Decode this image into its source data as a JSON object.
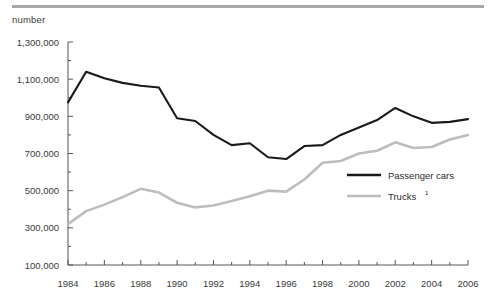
{
  "unit_label": "number",
  "legend": {
    "series1": "Passenger cars",
    "series2": "Trucks",
    "series2_footnote": "1"
  },
  "chart_data": {
    "type": "line",
    "title": "",
    "subtitle": "",
    "xlabel": "",
    "ylabel": "number",
    "grid": false,
    "legend_position": "inside-right",
    "xlim": [
      1984,
      2006
    ],
    "ylim": [
      100000,
      1300000
    ],
    "ytick_labels": [
      "1,300,000",
      "1,100,000",
      "900,000",
      "700,000",
      "500,000",
      "300,000",
      "100,000"
    ],
    "ytick_values": [
      1300000,
      1100000,
      900000,
      700000,
      500000,
      300000,
      100000
    ],
    "yminor_step": 100000,
    "xtick_labels": [
      "1984",
      "1986",
      "1988",
      "1990",
      "1992",
      "1994",
      "1996",
      "1998",
      "2000",
      "2002",
      "2004",
      "2006"
    ],
    "xtick_values": [
      1984,
      1986,
      1988,
      1990,
      1992,
      1994,
      1996,
      1998,
      2000,
      2002,
      2004,
      2006
    ],
    "x": [
      1984,
      1985,
      1986,
      1987,
      1988,
      1989,
      1990,
      1991,
      1992,
      1993,
      1994,
      1995,
      1996,
      1997,
      1998,
      1999,
      2000,
      2001,
      2002,
      2003,
      2004,
      2005,
      2006
    ],
    "series": [
      {
        "name": "Passenger cars",
        "color": "#1a1a1a",
        "values": [
          975000,
          1140000,
          1105000,
          1080000,
          1065000,
          1055000,
          890000,
          875000,
          800000,
          745000,
          755000,
          680000,
          670000,
          740000,
          745000,
          800000,
          840000,
          880000,
          945000,
          900000,
          865000,
          870000,
          885000
        ]
      },
      {
        "name": "Trucks",
        "color": "#bdbdbd",
        "values": [
          320000,
          390000,
          425000,
          465000,
          510000,
          490000,
          435000,
          410000,
          420000,
          445000,
          470000,
          500000,
          495000,
          560000,
          650000,
          660000,
          700000,
          715000,
          760000,
          730000,
          735000,
          775000,
          800000
        ]
      }
    ]
  }
}
